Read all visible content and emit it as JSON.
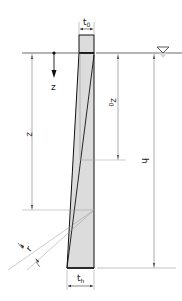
{
  "diagram": {
    "type": "tapered wall cross-section under hydrostatic water pressure",
    "labels": {
      "t0": "t",
      "t0_sub": "0",
      "th": "t",
      "th_sub": "h",
      "z": "z",
      "z_axis": "z",
      "z0": "z",
      "z0_sub": "0",
      "h": "h",
      "r": "r"
    },
    "colors": {
      "wall_fill": "#dcdcdc",
      "wall_stroke": "#111111",
      "dim_line": "#666666",
      "water_symbol": "#bbbbbb"
    },
    "symbols": {
      "water_level": "water-surface-triangle"
    }
  }
}
